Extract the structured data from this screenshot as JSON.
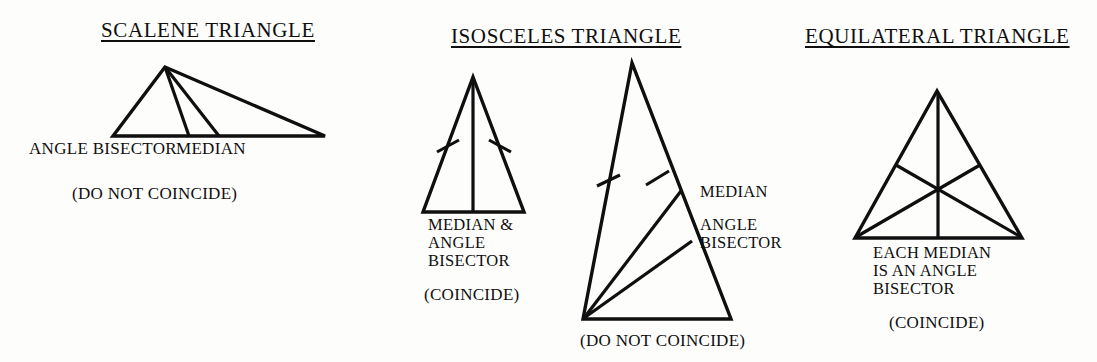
{
  "figure": {
    "kind": "geometry-diagram",
    "background_color": "#fdfdfc",
    "stroke_color": "#100f0f",
    "panels": [
      {
        "id": "scalene",
        "title": "SCALENE TRIANGLE",
        "triangle_type": "scalene",
        "vertices": [
          [
            165,
            67
          ],
          [
            113,
            136
          ],
          [
            325,
            136
          ]
        ],
        "cevians": [
          {
            "name": "angle-bisector",
            "from": [
              165,
              67
            ],
            "to": [
              189,
              136
            ]
          },
          {
            "name": "median",
            "from": [
              165,
              67
            ],
            "to": [
              219,
              136
            ]
          }
        ],
        "tick_marks": [],
        "labels": {
          "angle_bisector": "ANGLE BISECTOR",
          "median": "MEDIAN"
        },
        "note": "(DO NOT COINCIDE)"
      },
      {
        "id": "isosceles-coincide",
        "title": "ISOSCELES TRIANGLE",
        "triangle_type": "isosceles",
        "vertices": [
          [
            473,
            77
          ],
          [
            423,
            212
          ],
          [
            524,
            212
          ]
        ],
        "cevians": [
          {
            "name": "median-and-angle-bisector",
            "from": [
              473,
              77
            ],
            "to": [
              473,
              212
            ]
          }
        ],
        "tick_marks": [
          {
            "side": "left",
            "at": [
              447,
              146
            ]
          },
          {
            "side": "right",
            "at": [
              499,
              146
            ]
          }
        ],
        "labels": {
          "line1": "MEDIAN &",
          "line2": "ANGLE",
          "line3": "BISECTOR"
        },
        "note": "(COINCIDE)"
      },
      {
        "id": "isosceles-not-coincide",
        "triangle_type": "isosceles",
        "vertices": [
          [
            632,
            63
          ],
          [
            583,
            319
          ],
          [
            731,
            319
          ]
        ],
        "cevians": [
          {
            "name": "median",
            "from": [
              583,
              319
            ],
            "to": [
              681,
              191
            ]
          },
          {
            "name": "angle-bisector",
            "from": [
              583,
              319
            ],
            "to": [
              692,
              241
            ]
          }
        ],
        "tick_marks": [
          {
            "side": "left",
            "at": [
              608,
              180
            ]
          },
          {
            "side": "right",
            "at": [
              657,
              178
            ]
          }
        ],
        "labels": {
          "median": "MEDIAN",
          "angle_bisector_line1": "ANGLE",
          "angle_bisector_line2": "BISECTOR"
        },
        "note": "(DO NOT COINCIDE)"
      },
      {
        "id": "equilateral",
        "title": "EQUILATERAL TRIANGLE",
        "triangle_type": "equilateral",
        "vertices": [
          [
            937,
            91
          ],
          [
            855,
            238
          ],
          [
            1022,
            238
          ]
        ],
        "cevians": [
          {
            "name": "median-from-apex",
            "from": [
              937,
              91
            ],
            "to": [
              938,
              238
            ]
          },
          {
            "name": "median-from-left",
            "from": [
              855,
              238
            ],
            "to": [
              980,
              164
            ]
          },
          {
            "name": "median-from-right",
            "from": [
              1022,
              238
            ],
            "to": [
              896,
              164
            ]
          }
        ],
        "centroid": [
          937,
          190
        ],
        "tick_marks": [],
        "labels": {
          "line1": "EACH MEDIAN",
          "line2": "IS AN ANGLE",
          "line3": "BISECTOR"
        },
        "note": "(COINCIDE)"
      }
    ]
  }
}
